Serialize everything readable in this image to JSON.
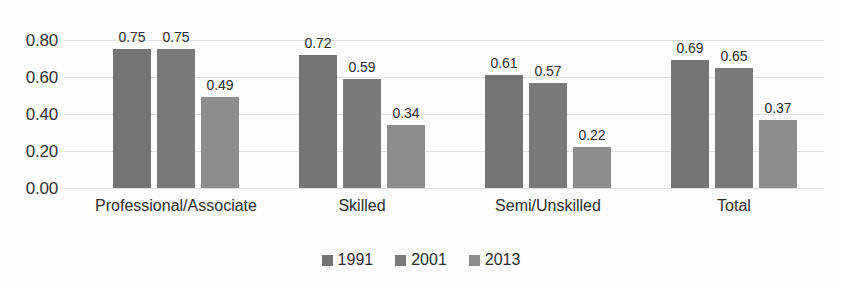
{
  "chart_data": {
    "type": "bar",
    "title": "",
    "subtitle": "",
    "xlabel": "",
    "ylabel": "",
    "categories": [
      "Professional/Associate",
      "Skilled",
      "Semi/Unskilled",
      "Total"
    ],
    "series": [
      {
        "name": "1991",
        "color": "#747474",
        "values": [
          0.75,
          0.72,
          0.61,
          0.69
        ]
      },
      {
        "name": "2001",
        "color": "#7a7a7a",
        "values": [
          0.75,
          0.59,
          0.57,
          0.65
        ]
      },
      {
        "name": "2013",
        "color": "#8d8d8d",
        "values": [
          0.49,
          0.34,
          0.22,
          0.37
        ]
      }
    ],
    "value_labels": [
      [
        "0.75",
        "0.72",
        "0.61",
        "0.69"
      ],
      [
        "0.75",
        "0.59",
        "0.57",
        "0.65"
      ],
      [
        "0.49",
        "0.34",
        "0.22",
        "0.37"
      ]
    ],
    "ylim": [
      0.0,
      0.8
    ],
    "yticks": [
      0.0,
      0.2,
      0.4,
      0.6,
      0.8
    ],
    "ytick_labels": [
      "0.00",
      "0.20",
      "0.40",
      "0.60",
      "0.80"
    ],
    "grid": true,
    "grid_color": "#e2e2e2",
    "legend_position": "bottom",
    "background": "#fdfdfd"
  },
  "axis": {
    "y_ticks": [
      {
        "label": "0.80",
        "value": 0.8
      },
      {
        "label": "0.60",
        "value": 0.6
      },
      {
        "label": "0.40",
        "value": 0.4
      },
      {
        "label": "0.20",
        "value": 0.2
      },
      {
        "label": "0.00",
        "value": 0.0
      }
    ]
  },
  "categories": [
    {
      "label": "Professional/Associate"
    },
    {
      "label": "Skilled"
    },
    {
      "label": "Semi/Unskilled"
    },
    {
      "label": "Total"
    }
  ],
  "legend": {
    "items": [
      {
        "label": "1991",
        "color": "#747474"
      },
      {
        "label": "2001",
        "color": "#7a7a7a"
      },
      {
        "label": "2013",
        "color": "#8d8d8d"
      }
    ]
  }
}
